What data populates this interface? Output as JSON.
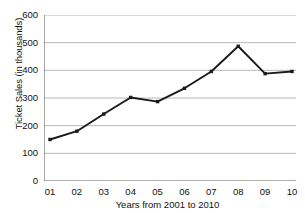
{
  "chart_data": {
    "type": "line",
    "title": "",
    "xlabel": "Years from 2001 to 2010",
    "ylabel": "Ticket Sales (in thousands)",
    "categories": [
      "01",
      "02",
      "03",
      "04",
      "05",
      "06",
      "07",
      "08",
      "09",
      "10"
    ],
    "values": [
      150,
      180,
      242,
      302,
      287,
      335,
      396,
      487,
      388,
      396
    ],
    "series": [
      {
        "name": "Ticket Sales",
        "values": [
          150,
          180,
          242,
          302,
          287,
          335,
          396,
          487,
          388,
          396
        ]
      }
    ],
    "ylim": [
      0,
      600
    ],
    "y_ticks": [
      0,
      100,
      200,
      300,
      400,
      500,
      600
    ],
    "y_tick_labels": [
      "0",
      "100",
      "200",
      "300",
      "400",
      "500",
      "600"
    ],
    "grid": true,
    "grid_axis": "y",
    "legend": "none",
    "marker": "filled-square",
    "line_color": "#1a1a1a",
    "marker_color": "#1a1a1a",
    "grid_color": "#b8b8b8",
    "axis_color": "#555555",
    "background": "#ffffff"
  }
}
